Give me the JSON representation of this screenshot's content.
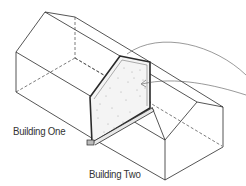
{
  "diagram": {
    "type": "isometric-building-firewall",
    "labels": {
      "building_one": "Building One",
      "building_two": "Building Two"
    },
    "colors": {
      "line": "#2a2a2a",
      "hidden_line": "#444444",
      "wall_fill": "#f4f4f4",
      "stipple": "#9a9a9a",
      "background": "#ffffff"
    }
  }
}
